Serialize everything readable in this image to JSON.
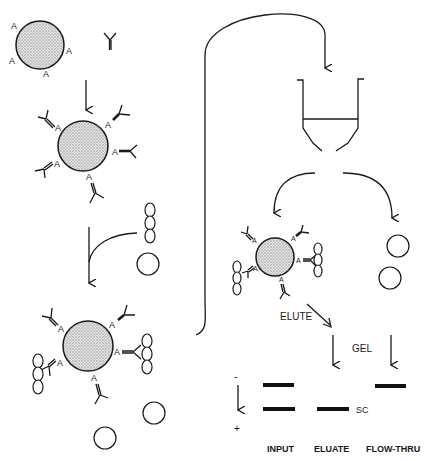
{
  "diagram": {
    "type": "immunoprecipitation-workflow",
    "bead_label": "A",
    "labels": {
      "elute": "ELUTE",
      "gel": "GEL",
      "minus": "-",
      "plus": "+",
      "sc": "SC"
    },
    "lanes": [
      {
        "label": "INPUT",
        "bands": [
          "upper",
          "lower"
        ]
      },
      {
        "label": "ELUATE",
        "bands": [
          "lower"
        ]
      },
      {
        "label": "FLOW-THRU",
        "bands": [
          "upper"
        ]
      }
    ],
    "colors": {
      "stroke": "#1a1a1a",
      "background": "#ffffff"
    }
  }
}
